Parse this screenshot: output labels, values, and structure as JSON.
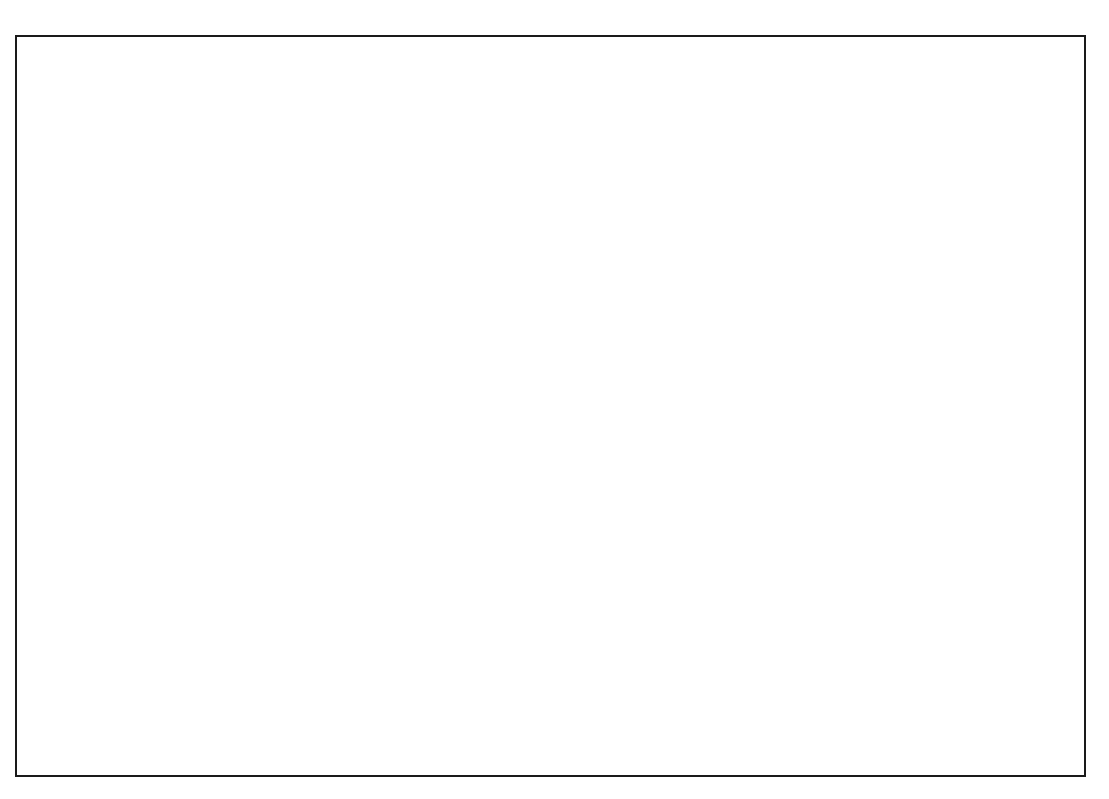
{
  "chart_data": [
    {
      "id": "main",
      "type": "line",
      "title": "",
      "xlabel": "",
      "ylabel": "",
      "categories": [
        "1980",
        "1988",
        "1990",
        "1995",
        "2000",
        "2005",
        "2010"
      ],
      "ytick_labels": [
        "0",
        "100",
        "200",
        "300",
        "400",
        "500",
        "600",
        "700",
        "800",
        "900",
        "1,000"
      ],
      "ytick_values": [
        0,
        100,
        200,
        300,
        400,
        500,
        600,
        700,
        800,
        900,
        1000
      ],
      "ylim": [
        0,
        1000
      ],
      "grid": false,
      "legend_position": "inline-right",
      "series": [
        {
          "name": "Incidence",
          "label_base": "Incidence",
          "label_multiplier": "× 10",
          "label_exponent": "3",
          "label_full": "Incidence × 10³",
          "x": [
            "1990",
            "1995",
            "2000",
            "2005",
            "2010"
          ],
          "values": [
            328,
            380,
            428,
            550,
            670
          ],
          "color": "#000000"
        },
        {
          "name": "Mortality",
          "label_base": "Mortality",
          "label_multiplier": "× 10",
          "label_exponent": "3",
          "label_full": "Mortality × 10³",
          "x": [
            "1980",
            "1988",
            "1990",
            "1995",
            "2000",
            "2005",
            "2010"
          ],
          "values": [
            248,
            268,
            272,
            282,
            286,
            290,
            277
          ],
          "color": "#000000"
        },
        {
          "name": "Hospitalization",
          "label_base": "Hospitalization",
          "label_multiplier": "× 10",
          "label_exponent": "5",
          "label_full": "Hospitalization × 10⁵",
          "x": [
            "1980",
            "1988",
            "1990",
            "1995",
            "2000",
            "2005",
            "2010"
          ],
          "values": [
            134,
            175,
            190,
            209,
            214,
            214,
            194
          ],
          "color": "#000000"
        }
      ]
    },
    {
      "id": "inset",
      "type": "bar",
      "title": "",
      "xlabel": "",
      "ylabel": "",
      "categories": [
        "1980",
        "1988",
        "1990",
        "1995",
        "2000",
        "2005",
        "2010"
      ],
      "bar_categories": [
        "1988",
        "1995",
        "2010"
      ],
      "grid": false,
      "legend_position": "top-right-inside",
      "series": [
        {
          "name": "% Hospital Mortality",
          "legend_label": "% Hospital Mortality",
          "color": "#595959",
          "values": [
            8.1,
            7.2,
            3.4
          ],
          "value_labels": [
            "8.1",
            "7.2",
            "3.4"
          ],
          "trendline": {
            "style": "dashed",
            "color": "#4d4d4d",
            "start": 8.75,
            "end": 3.1
          }
        },
        {
          "name": "Prevelance",
          "legend_label_base": "Prevelance",
          "legend_label_multiplier": "× 10",
          "legend_label_exponent": "6",
          "legend_label": "Prevelance × 10⁶",
          "color": "#c2c2c2",
          "values": [
            4.4,
            5.0,
            5.7
          ],
          "value_labels": [
            "4.4",
            "5",
            "5.7"
          ],
          "trendline": {
            "style": "dashed",
            "color": "#b3b3b3",
            "start": 4.25,
            "end": 5.85
          }
        }
      ]
    }
  ],
  "colors": {
    "axis": "#1a1a1a",
    "line": "#000000",
    "bar_dark": "#595959",
    "bar_light": "#c2c2c2",
    "trend_dark": "#4d4d4d",
    "trend_light": "#b3b3b3",
    "frame": "#1a1a1a",
    "background": "#ffffff"
  }
}
